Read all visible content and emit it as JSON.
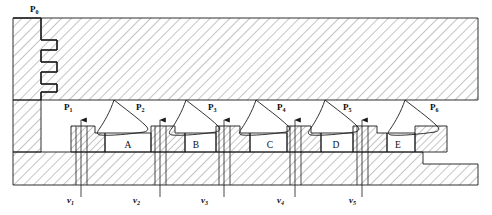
{
  "diagram": {
    "type": "engineering-cross-section",
    "colors": {
      "line": "#1a1a1a",
      "hatch": "#555555",
      "background": "#ffffff",
      "text": "#0d0d0d"
    },
    "ambient_pressure": {
      "symbol": "P",
      "sub": "0",
      "x": 30,
      "y": 12
    },
    "pressure_labels": [
      {
        "symbol": "P",
        "sub": "1",
        "x": 64,
        "y": 110
      },
      {
        "symbol": "P",
        "sub": "2",
        "x": 136,
        "y": 110
      },
      {
        "symbol": "P",
        "sub": "3",
        "x": 208,
        "y": 110
      },
      {
        "symbol": "P",
        "sub": "4",
        "x": 277,
        "y": 110
      },
      {
        "symbol": "P",
        "sub": "5",
        "x": 343,
        "y": 110
      },
      {
        "symbol": "P",
        "sub": "6",
        "x": 430,
        "y": 110
      }
    ],
    "velocity_labels": [
      {
        "symbol": "v",
        "sub": "1",
        "x": 81,
        "y": 203
      },
      {
        "symbol": "v",
        "sub": "2",
        "x": 137,
        "y": 203
      },
      {
        "symbol": "v",
        "sub": "3",
        "x": 205,
        "y": 203
      },
      {
        "symbol": "v",
        "sub": "4",
        "x": 281,
        "y": 203
      },
      {
        "symbol": "v",
        "sub": "5",
        "x": 353,
        "y": 203
      }
    ],
    "chambers": [
      {
        "label": "A",
        "x": 128,
        "y": 148
      },
      {
        "label": "B",
        "x": 196,
        "y": 148
      },
      {
        "label": "C",
        "x": 270,
        "y": 148
      },
      {
        "label": "D",
        "x": 336,
        "y": 148
      },
      {
        "label": "E",
        "x": 398,
        "y": 148
      }
    ],
    "flow_arrows": [
      {
        "name": "flow-arrow-1",
        "x": 81
      },
      {
        "name": "flow-arrow-2",
        "x": 160
      },
      {
        "name": "flow-arrow-3",
        "x": 224
      },
      {
        "name": "flow-arrow-4",
        "x": 295
      },
      {
        "name": "flow-arrow-5",
        "x": 362
      }
    ]
  }
}
